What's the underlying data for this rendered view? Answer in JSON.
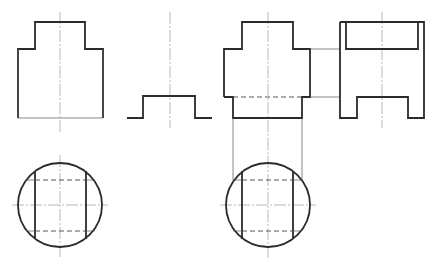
{
  "drawing": {
    "title": "Orthographic projection exercise",
    "colors": {
      "line": "#2b2b2b",
      "thin": "#555555",
      "center": "#8a8a8a",
      "background": "#ffffff"
    },
    "figure_left": {
      "front_view": "Stepped block outline (top boss on wider base)",
      "profile_view": "Raised bump profile",
      "top_view": "Circle with two vertical chords and hidden lines"
    },
    "figure_right": {
      "front_view": "Stepped block with lower narrower section, hidden line at step",
      "side_view": "Rectangular side view with top slot and bottom notch",
      "top_view": "Circle with two vertical chords, hidden lines and projection lines"
    }
  }
}
